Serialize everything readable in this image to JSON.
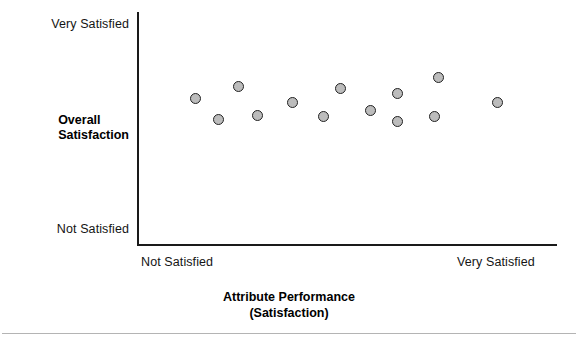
{
  "chart_data": {
    "type": "scatter",
    "title": "",
    "xlabel": "Attribute Performance",
    "xlabel_line2": "(Satisfaction)",
    "ylabel": "Overall",
    "ylabel_line2": "Satisfaction",
    "grid": false,
    "legend": "none",
    "xlim": [
      0,
      100
    ],
    "ylim": [
      0,
      100
    ],
    "x_tick_labels": [
      "Not Satisfied",
      "Very Satisfied"
    ],
    "y_tick_labels": [
      "Not Satisfied",
      "Very Satisfied"
    ],
    "marker": {
      "shape": "circle",
      "fill_color": "#bcbcbc",
      "edge_color": "#222222",
      "size_px": 11
    },
    "point_count": 13,
    "points": [
      {
        "x": 13.8,
        "y": 63.1,
        "px": 195,
        "py": 98
      },
      {
        "x": 19.3,
        "y": 68.2,
        "px": 218,
        "py": 119
      },
      {
        "x": 24.0,
        "y": 68.4,
        "px": 238,
        "py": 86
      },
      {
        "x": 28.3,
        "y": 55.6,
        "px": 257,
        "py": 115
      },
      {
        "x": 36.7,
        "y": 61.1,
        "px": 292,
        "py": 102
      },
      {
        "x": 44.3,
        "y": 55.1,
        "px": 323,
        "py": 116
      },
      {
        "x": 48.1,
        "y": 67.1,
        "px": 340,
        "py": 88
      },
      {
        "x": 55.2,
        "y": 57.7,
        "px": 370,
        "py": 110
      },
      {
        "x": 61.7,
        "y": 65.0,
        "px": 397,
        "py": 93
      },
      {
        "x": 61.7,
        "y": 53.0,
        "px": 397,
        "py": 121
      },
      {
        "x": 70.6,
        "y": 55.1,
        "px": 434,
        "py": 116
      },
      {
        "x": 71.5,
        "y": 71.8,
        "px": 438,
        "py": 77
      },
      {
        "x": 85.5,
        "y": 61.1,
        "px": 497,
        "py": 102
      }
    ]
  },
  "axes": {
    "y_top_label": "Very Satisfied",
    "y_bottom_label": "Not Satisfied",
    "y_title_line1": "Overall",
    "y_title_line2": "Satisfaction",
    "x_left_label": "Not Satisfied",
    "x_right_label": "Very Satisfied",
    "x_title_line1": "Attribute Performance",
    "x_title_line2": "(Satisfaction)"
  },
  "colors": {
    "axis": "#1a1a1a",
    "text": "#141414",
    "marker_fill": "#bcbcbc",
    "marker_edge": "#222222",
    "background": "#ffffff",
    "rule": "#b4b4b4"
  }
}
